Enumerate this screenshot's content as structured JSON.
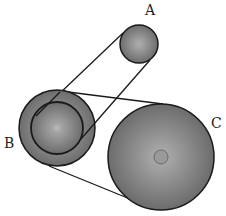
{
  "diagram": {
    "type": "pulley-belt-system",
    "labels": {
      "a": "A",
      "b": "B",
      "c": "C"
    },
    "pulleys": [
      {
        "id": "A",
        "cx": 139,
        "cy": 44,
        "r": 19
      },
      {
        "id": "B",
        "cx": 57,
        "cy": 128,
        "r": 38,
        "inner_r": 26
      },
      {
        "id": "C",
        "cx": 161,
        "cy": 157,
        "r": 53
      }
    ],
    "colors": {
      "pulley_fill_center": "#a6a6a6",
      "pulley_fill_edge": "#6e6e6e",
      "stroke": "#1a1a1a",
      "hub": "#9a9a9a"
    }
  }
}
